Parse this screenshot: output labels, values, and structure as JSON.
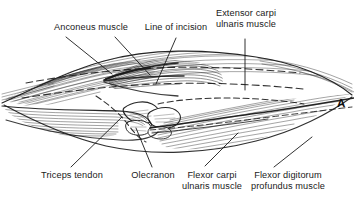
{
  "figure": {
    "panel_letter": "A",
    "background_color": "#ffffff",
    "ink_color": "#1a1a1a"
  },
  "labels": {
    "anconeus": "Anconeus muscle",
    "line_of_incision": "Line of incision",
    "extensor_carpi_ulnaris_l1": "Extensor carpi",
    "extensor_carpi_ulnaris_l2": "ulnaris muscle",
    "triceps_tendon": "Triceps tendon",
    "olecranon": "Olecranon",
    "flexor_carpi_ulnaris_l1": "Flexor carpi",
    "flexor_carpi_ulnaris_l2": "ulnaris muscle",
    "flexor_digitorum_l1": "Flexor digitorum",
    "flexor_digitorum_l2": "profundus muscle"
  }
}
